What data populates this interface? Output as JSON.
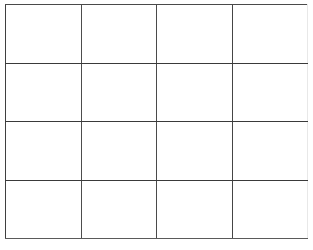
{
  "document": {
    "kind": "blank-grid-table",
    "background_color": "#ffffff",
    "line_color": "#3a3a3a",
    "width_px": 313,
    "height_px": 250
  },
  "table": {
    "caption": "",
    "column_count": 4,
    "row_count": 4,
    "has_header_row": false,
    "columns": [
      "",
      "",
      "",
      ""
    ],
    "rows": [
      {
        "cells": [
          "",
          "",
          "",
          ""
        ]
      },
      {
        "cells": [
          "",
          "",
          "",
          ""
        ]
      },
      {
        "cells": [
          "",
          "",
          "",
          ""
        ]
      },
      {
        "cells": [
          "",
          "",
          "",
          ""
        ]
      }
    ]
  }
}
